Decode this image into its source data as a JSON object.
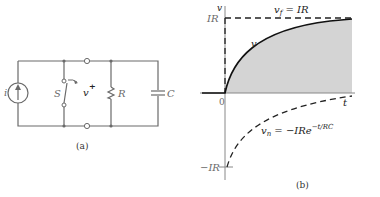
{
  "figure_a": {
    "caption": "(a)",
    "labels": {
      "source": "i",
      "switch": "S",
      "voltage": "v",
      "voltage_polarity": "+",
      "resistor": "R",
      "capacitor": "C"
    }
  },
  "figure_b": {
    "caption": "(b)",
    "y_axis_label": "v",
    "x_axis_label": "t",
    "tick_top": "IR",
    "tick_zero": "0",
    "tick_bottom": "−IR",
    "curve_label": "v",
    "final_label": "v_f = IR",
    "final_label_main": "v",
    "final_label_sub": "f",
    "final_label_rest": " = IR",
    "natural_label_main": "v",
    "natural_label_sub": "n",
    "natural_label_rest": " = −IRe",
    "natural_label_exp": "−t/RC"
  },
  "colors": {
    "line": "#222222",
    "shade": "#d4d4d4",
    "wire": "#6a6a6a"
  }
}
